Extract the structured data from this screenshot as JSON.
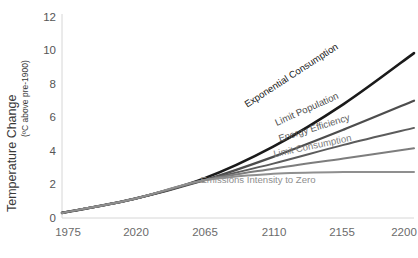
{
  "chart_data": {
    "type": "line",
    "title": "",
    "subtitle": "",
    "xlabel": "",
    "ylabel": "Temperature Change (ºC above pre-1900)",
    "ylabel_main": "Temperature Change",
    "ylabel_paren": "(ºC above pre-1900)",
    "xlim": [
      1975,
      2200
    ],
    "ylim": [
      0,
      12
    ],
    "grid": false,
    "legend_position": "inline-curve-labels",
    "x_ticks": [
      "1975",
      "2020",
      "2065",
      "2110",
      "2155",
      "2200"
    ],
    "x_tick_values": [
      1975,
      2020,
      2065,
      2110,
      2155,
      2200
    ],
    "y_ticks": [
      "0",
      "2",
      "4",
      "6",
      "8",
      "10",
      "12"
    ],
    "y_tick_values": [
      0,
      2,
      4,
      6,
      8,
      10,
      12
    ],
    "x": [
      1975,
      2020,
      2065,
      2110,
      2155,
      2200
    ],
    "series": [
      {
        "name": "Exponential Consumption",
        "color": "#1a1a1a",
        "values": [
          0.3,
          1.1,
          2.3,
          4.2,
          6.7,
          9.7
        ],
        "label_rotation": -33,
        "label_x": 293,
        "label_y": 78
      },
      {
        "name": "Limit Population",
        "color": "#4d4d4d",
        "values": [
          0.3,
          1.1,
          2.2,
          3.6,
          5.2,
          6.9
        ],
        "label_rotation": -24,
        "label_x": 308,
        "label_y": 112
      },
      {
        "name": "Energy Efficiency",
        "color": "#5c5c5c",
        "values": [
          0.3,
          1.1,
          2.2,
          3.2,
          4.3,
          5.3
        ],
        "label_rotation": -17,
        "label_x": 315,
        "label_y": 131
      },
      {
        "name": "Limit Consumption",
        "color": "#7d7d7d",
        "values": [
          0.3,
          1.1,
          2.2,
          2.9,
          3.5,
          4.1
        ],
        "label_rotation": -12,
        "label_x": 313,
        "label_y": 149
      },
      {
        "name": "Emissions Intensity to Zero",
        "color": "#8f8f8f",
        "values": [
          0.3,
          1.1,
          2.2,
          2.6,
          2.7,
          2.7
        ],
        "label_rotation": 0,
        "label_x": 258,
        "label_y": 183
      }
    ]
  }
}
